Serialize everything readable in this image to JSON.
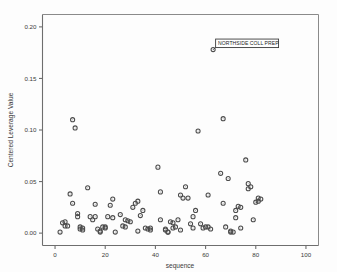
{
  "chart_data": {
    "type": "scatter",
    "title": "",
    "xlabel": "sequence",
    "ylabel": "Centered Leverage Value",
    "xlim": [
      -5,
      105
    ],
    "ylim": [
      -0.012,
      0.212
    ],
    "xticks": [
      0,
      20,
      40,
      60,
      80,
      100
    ],
    "xticklabels": [
      "0",
      "20",
      "40",
      "60",
      "80",
      "100"
    ],
    "yticks": [
      0.0,
      0.05,
      0.1,
      0.15,
      0.2
    ],
    "yticklabels": [
      "0.00",
      "0.05",
      "0.10",
      "0.15",
      "0.20"
    ],
    "grid": false,
    "legend": false,
    "marker": "open-circle",
    "annotations": [
      {
        "label": "NORTHSIDE COLL PREP",
        "x": 63,
        "y": 0.178
      }
    ],
    "series": [
      {
        "name": "Centered Leverage Value",
        "points": [
          [
            2,
            0.001
          ],
          [
            3,
            0.01
          ],
          [
            4,
            0.011
          ],
          [
            4,
            0.007
          ],
          [
            5,
            0.007
          ],
          [
            6,
            0.038
          ],
          [
            7,
            0.029
          ],
          [
            7,
            0.11
          ],
          [
            8,
            0.102
          ],
          [
            9,
            0.019
          ],
          [
            9,
            0.016
          ],
          [
            10,
            0.006
          ],
          [
            10,
            0.004
          ],
          [
            11,
            0.005
          ],
          [
            11,
            0.003
          ],
          [
            13,
            0.044
          ],
          [
            14,
            0.016
          ],
          [
            15,
            0.013
          ],
          [
            16,
            0.016
          ],
          [
            16,
            0.028
          ],
          [
            17,
            0.004
          ],
          [
            18,
            0.002
          ],
          [
            18,
            0.001
          ],
          [
            19,
            0.006
          ],
          [
            20,
            0.006
          ],
          [
            20,
            0.005
          ],
          [
            21,
            0.016
          ],
          [
            22,
            0.027
          ],
          [
            23,
            0.033
          ],
          [
            23,
            0.015
          ],
          [
            24,
            0.001
          ],
          [
            26,
            0.018
          ],
          [
            27,
            0.007
          ],
          [
            28,
            0.006
          ],
          [
            28,
            0.013
          ],
          [
            29,
            0.012
          ],
          [
            30,
            0.011
          ],
          [
            31,
            0.025
          ],
          [
            32,
            0.029
          ],
          [
            33,
            0.002
          ],
          [
            33,
            0.031
          ],
          [
            34,
            0.017
          ],
          [
            35,
            0.022
          ],
          [
            36,
            0.005
          ],
          [
            37,
            0.004
          ],
          [
            38,
            0.005
          ],
          [
            38,
            0.003
          ],
          [
            41,
            0.064
          ],
          [
            42,
            0.04
          ],
          [
            42,
            0.013
          ],
          [
            44,
            0.004
          ],
          [
            44,
            0.003
          ],
          [
            45,
            0.001
          ],
          [
            45,
            0.001
          ],
          [
            46,
            0.011
          ],
          [
            47,
            0.01
          ],
          [
            47,
            0.005
          ],
          [
            48,
            0.006
          ],
          [
            49,
            0.013
          ],
          [
            50,
            0.037
          ],
          [
            50,
            0.003
          ],
          [
            51,
            0.034
          ],
          [
            52,
            0.045
          ],
          [
            53,
            0.034
          ],
          [
            54,
            0.009
          ],
          [
            55,
            0.016
          ],
          [
            55,
            0.005
          ],
          [
            56,
            0.022
          ],
          [
            57,
            0.099
          ],
          [
            58,
            0.009
          ],
          [
            59,
            0.005
          ],
          [
            60,
            0.006
          ],
          [
            61,
            0.037
          ],
          [
            61,
            0.006
          ],
          [
            62,
            0.004
          ],
          [
            63,
            0.178
          ],
          [
            66,
            0.058
          ],
          [
            67,
            0.029
          ],
          [
            67,
            0.111
          ],
          [
            68,
            0.006
          ],
          [
            69,
            0.053
          ],
          [
            70,
            0.002
          ],
          [
            70,
            0.001
          ],
          [
            71,
            0.001
          ],
          [
            72,
            0.022
          ],
          [
            72,
            0.015
          ],
          [
            73,
            0.026
          ],
          [
            74,
            0.025
          ],
          [
            74,
            0.005
          ],
          [
            76,
            0.071
          ],
          [
            77,
            0.043
          ],
          [
            77,
            0.048
          ],
          [
            78,
            0.045
          ],
          [
            79,
            0.013
          ],
          [
            80,
            0.03
          ],
          [
            81,
            0.031
          ],
          [
            81,
            0.034
          ],
          [
            82,
            0.033
          ]
        ]
      }
    ]
  },
  "axes": {
    "x_title": "sequence",
    "y_title": "Centered Leverage Value"
  }
}
